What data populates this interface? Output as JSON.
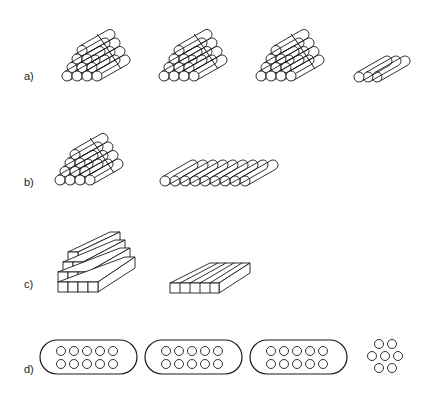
{
  "rows": [
    {
      "label": "a)",
      "description": "Three triangular stacks of 10 round bars each, and a group of 3 bars"
    },
    {
      "label": "b)",
      "description": "Triangular stack of 10 round bars vs. flat single layer of 9 bars"
    },
    {
      "label": "c)",
      "description": "Stepped stack of square bars vs. flat layer of 5 square bars"
    },
    {
      "label": "d)",
      "description": "Three oval bundles with 10 circles each, and a hexagonal group of 7 circles"
    }
  ],
  "colors": {
    "stroke": "#1a1a1a",
    "background": "#ffffff"
  }
}
